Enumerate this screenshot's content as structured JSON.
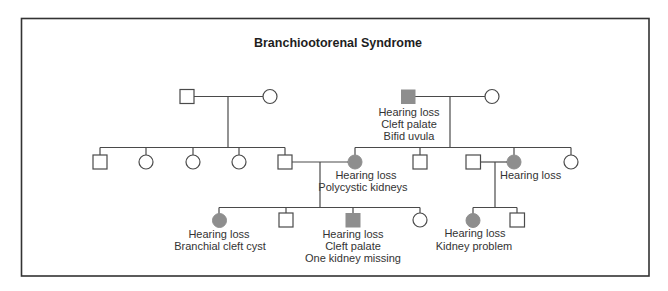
{
  "title": "Branchiootorenal Syndrome",
  "colors": {
    "affected_fill": "#8e8e8e",
    "unaffected_fill": "#ffffff",
    "line": "#4a4a4a"
  },
  "legend_semantics": {
    "square": "male",
    "circle": "female",
    "gray_filled": "affected"
  },
  "generation_1": {
    "left_couple": {
      "male": {
        "sex": "male",
        "affected": false
      },
      "female": {
        "sex": "female",
        "affected": false
      }
    },
    "right_couple": {
      "male": {
        "sex": "male",
        "affected": true,
        "labels": [
          "Hearing loss",
          "Cleft palate",
          "Bifid uvula"
        ]
      },
      "female": {
        "sex": "female",
        "affected": false
      }
    }
  },
  "generation_2": {
    "left_sibship": [
      {
        "sex": "male",
        "affected": false
      },
      {
        "sex": "female",
        "affected": false
      },
      {
        "sex": "female",
        "affected": false
      },
      {
        "sex": "female",
        "affected": false
      },
      {
        "sex": "male",
        "affected": false,
        "note": "married to right sibship daughter"
      }
    ],
    "right_sibship": [
      {
        "sex": "female",
        "affected": true,
        "labels": [
          "Hearing loss",
          "Polycystic kidneys"
        ]
      },
      {
        "sex": "male",
        "affected": false
      },
      {
        "sex": "female",
        "affected": true,
        "labels": [
          "Hearing loss"
        ],
        "spouse": {
          "sex": "male",
          "affected": false
        }
      },
      {
        "sex": "female",
        "affected": false
      }
    ]
  },
  "generation_3": {
    "left_family_children": [
      {
        "sex": "female",
        "affected": true,
        "labels": [
          "Hearing loss",
          "Branchial cleft cyst"
        ]
      },
      {
        "sex": "male",
        "affected": false
      },
      {
        "sex": "male",
        "affected": true,
        "labels": [
          "Hearing loss",
          "Cleft palate",
          "One kidney missing"
        ]
      },
      {
        "sex": "female",
        "affected": false
      }
    ],
    "right_family_children": [
      {
        "sex": "female",
        "affected": true,
        "labels": [
          "Hearing loss",
          "Kidney problem"
        ]
      },
      {
        "sex": "male",
        "affected": false
      }
    ]
  }
}
